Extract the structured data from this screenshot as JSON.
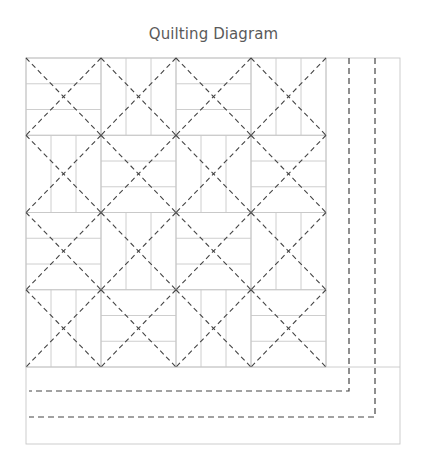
{
  "title": "Quilting Diagram",
  "diagram": {
    "quilt": {
      "left": 26,
      "top": 58,
      "right": 400,
      "bottom": 444
    },
    "blocks": {
      "left": 26,
      "top": 58,
      "cols": 4,
      "rows": 4,
      "block_w": 75,
      "block_h": 77.25,
      "strips_per_block": 3,
      "pattern": [
        [
          "H",
          "V",
          "H",
          "V"
        ],
        [
          "V",
          "H",
          "V",
          "H"
        ],
        [
          "H",
          "V",
          "H",
          "V"
        ],
        [
          "V",
          "H",
          "V",
          "H"
        ]
      ]
    },
    "border_quilting_lines": [
      {
        "x": 349,
        "y": 391
      },
      {
        "x": 375,
        "y": 417
      }
    ],
    "colors": {
      "seam": "#c8c8c8",
      "quilting": "#444444",
      "title": "#5a5a5a"
    }
  }
}
